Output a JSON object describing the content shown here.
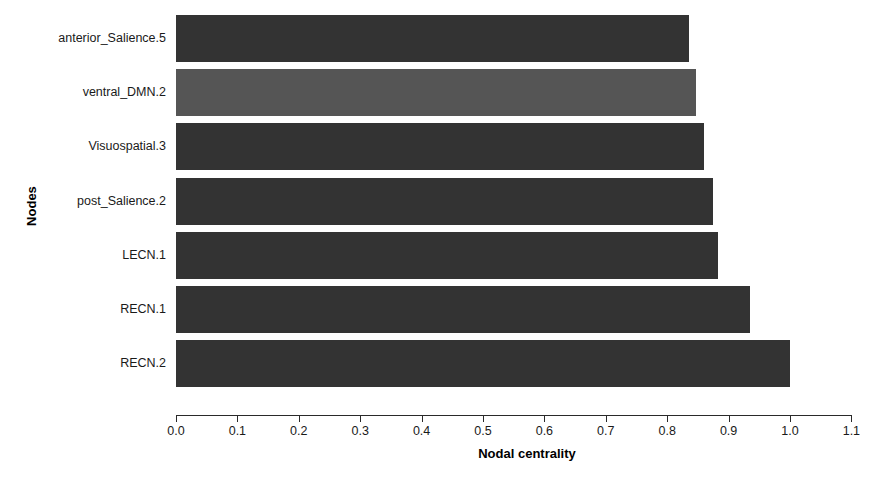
{
  "chart_data": {
    "type": "bar",
    "orientation": "horizontal",
    "title": "",
    "xlabel": "Nodal centrality",
    "ylabel": "Nodes",
    "xlim": [
      0.0,
      1.1
    ],
    "xticks": [
      "0.0",
      "0.1",
      "0.2",
      "0.3",
      "0.4",
      "0.5",
      "0.6",
      "0.7",
      "0.8",
      "0.9",
      "1.0",
      "1.1"
    ],
    "xtick_values": [
      0.0,
      0.1,
      0.2,
      0.3,
      0.4,
      0.5,
      0.6,
      0.7,
      0.8,
      0.9,
      1.0,
      1.1
    ],
    "grid": false,
    "legend": false,
    "categories": [
      "anterior_Salience.5",
      "ventral_DMN.2",
      "Visuospatial.3",
      "post_Salience.2",
      "LECN.1",
      "RECN.1",
      "RECN.2"
    ],
    "values": [
      0.836,
      0.847,
      0.86,
      0.874,
      0.882,
      0.935,
      1.0
    ],
    "bar_colors": [
      "#333333",
      "#555555",
      "#333333",
      "#333333",
      "#333333",
      "#333333",
      "#333333"
    ],
    "series": [
      {
        "name": "Nodal centrality",
        "values": [
          0.836,
          0.847,
          0.86,
          0.874,
          0.882,
          0.935,
          1.0
        ]
      }
    ]
  },
  "colors": {
    "bar_default": "#333333",
    "bar_highlight": "#555555",
    "axis": "#2a2a2a",
    "text": "#1a1a1a",
    "background": "#ffffff"
  }
}
